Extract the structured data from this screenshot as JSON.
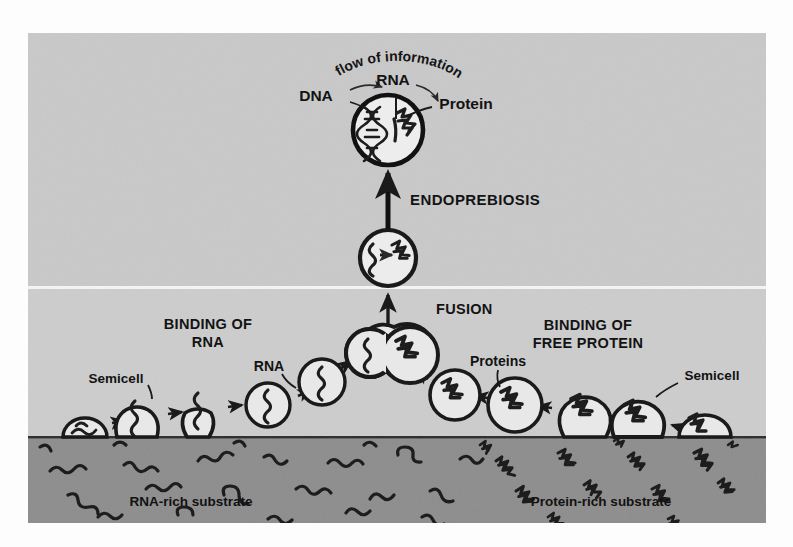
{
  "figure": {
    "title_concept": "Endoprebiosis origin-of-cell diagram",
    "background": {
      "upper_band_color": "#c9c9c9",
      "lower_band_color": "#cdcdcd",
      "substrate_color": "#8d8d8d",
      "divider_color": "#f4f4f4",
      "cell_fill": "#e6e6e6",
      "outline_color": "#1a1a1a",
      "page_color": "#fdfdfd"
    },
    "labels": {
      "flow_of_information": "flow of information",
      "dna": "DNA",
      "rna_top": "RNA",
      "protein_top": "Protein",
      "endoprebiosis": "ENDOPREBIOSIS",
      "fusion": "FUSION",
      "binding_of_rna_line1": "BINDING OF",
      "binding_of_rna_line2": "RNA",
      "binding_of_free_protein_line1": "BINDING OF",
      "binding_of_free_protein_line2": "FREE PROTEIN",
      "rna_callout": "RNA",
      "proteins_callout": "Proteins",
      "semicell_left": "Semicell",
      "semicell_right": "Semicell",
      "rna_rich_substrate": "RNA-rich substrate",
      "protein_rich_substrate": "Protein-rich substrate"
    },
    "nucleated_cell": {
      "cx": 360,
      "cy": 97,
      "r": 35,
      "contents": [
        "dna-double-helix",
        "rna-strand",
        "protein-aggregate"
      ]
    },
    "fused_cell": {
      "cx": 360,
      "cy": 225,
      "r": 28,
      "contents": [
        "rna-strand",
        "conversion-arrow",
        "protein-aggregate"
      ]
    },
    "fusion_pair": {
      "left": {
        "cx": 342,
        "cy": 320,
        "r": 24,
        "content": "rna-strand"
      },
      "right": {
        "cx": 382,
        "cy": 322,
        "r": 28,
        "content": "protein-aggregate"
      }
    },
    "rna_branch_cells": [
      {
        "cx": 57,
        "cy": 399,
        "r": 22,
        "type": "dome",
        "content": "rna-strand"
      },
      {
        "cx": 109,
        "cy": 385,
        "r": 22,
        "type": "budding",
        "content": "rna-strand"
      },
      {
        "cx": 169,
        "cy": 377,
        "r": 23,
        "type": "budding",
        "content": "rna-strand"
      },
      {
        "cx": 240,
        "cy": 372,
        "r": 22,
        "type": "free",
        "content": "rna-strand"
      },
      {
        "cx": 294,
        "cy": 349,
        "r": 23,
        "type": "free",
        "content": "rna-strand"
      }
    ],
    "protein_branch_cells": [
      {
        "cx": 427,
        "cy": 362,
        "r": 25,
        "type": "free",
        "content": "protein-aggregate"
      },
      {
        "cx": 487,
        "cy": 372,
        "r": 27,
        "type": "free",
        "content": "protein-aggregate"
      },
      {
        "cx": 557,
        "cy": 382,
        "r": 27,
        "type": "budding",
        "content": "protein-aggregate"
      },
      {
        "cx": 610,
        "cy": 385,
        "r": 28,
        "type": "budding",
        "content": "protein-aggregate"
      },
      {
        "cx": 677,
        "cy": 397,
        "r": 26,
        "type": "dome",
        "content": "protein-aggregate"
      }
    ],
    "substrate": {
      "top_y": 404,
      "rna_molecule_count": 22,
      "protein_molecule_count": 18
    },
    "arrows": {
      "vertical_big": {
        "from_y": 205,
        "to_y": 140,
        "x": 360
      },
      "vertical_small": {
        "from_y": 290,
        "to_y": 258,
        "x": 360
      },
      "chain_arrow_count": 12
    }
  }
}
